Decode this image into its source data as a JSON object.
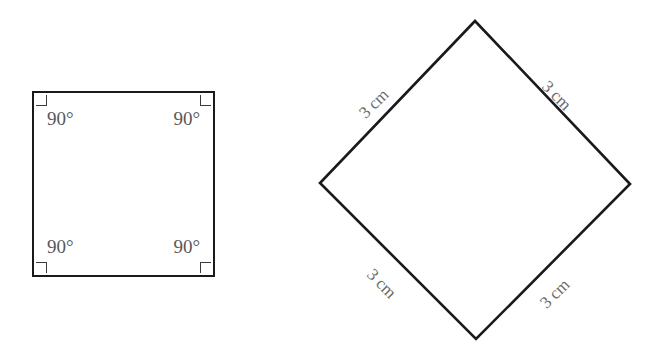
{
  "figures": {
    "square": {
      "name": "square-with-right-angles",
      "angle_labels": [
        {
          "position": "top-left",
          "text": "90°"
        },
        {
          "position": "top-right",
          "text": "90°"
        },
        {
          "position": "bottom-left",
          "text": "90°"
        },
        {
          "position": "bottom-right",
          "text": "90°"
        }
      ],
      "right_angle_markers": [
        {
          "position": "top-left"
        },
        {
          "position": "top-right"
        },
        {
          "position": "bottom-left"
        },
        {
          "position": "bottom-right"
        }
      ]
    },
    "diamond": {
      "name": "rotated-square-with-side-lengths",
      "side_labels": [
        {
          "position": "top-left",
          "text": "3 cm"
        },
        {
          "position": "top-right",
          "text": "3 cm"
        },
        {
          "position": "bottom-left",
          "text": "3 cm"
        },
        {
          "position": "bottom-right",
          "text": "3 cm"
        }
      ],
      "vertices": "475,21 630,184 476,339 320,183"
    }
  },
  "colors": {
    "background": "#ffffff",
    "stroke": "#1a1a1a",
    "angle_text": "#58585a",
    "side_text": "#6a6a6c",
    "marker_stroke": "#3a3a3a"
  }
}
